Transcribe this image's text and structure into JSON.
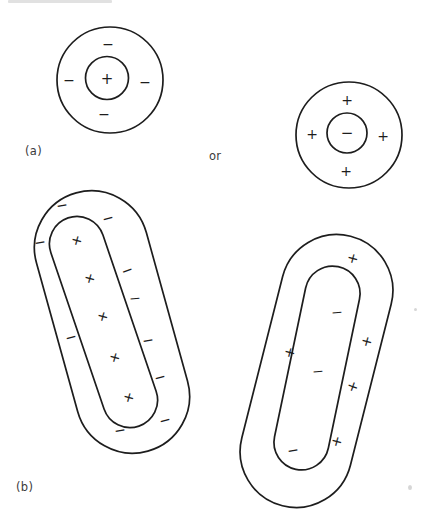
{
  "labels": {
    "panel_a": "(a)",
    "panel_b": "(b)",
    "conjunction": "or"
  },
  "colors": {
    "stroke": "#1d1d1d",
    "label": "#3b3b3b",
    "background": "#ffffff"
  },
  "diagram": {
    "shapes": [
      {
        "id": "charged-sphere-positive-core",
        "parts": [
          {
            "kind": "circle",
            "name": "outer-boundary",
            "cx": 110,
            "cy": 80,
            "r": 53
          },
          {
            "kind": "circle",
            "name": "inner-core",
            "cx": 107,
            "cy": 78,
            "r": 21.5
          }
        ],
        "signs": [
          {
            "glyph": "+",
            "x": 107,
            "y": 79,
            "size": 15
          },
          {
            "glyph": "−",
            "x": 108,
            "y": 44
          },
          {
            "glyph": "−",
            "x": 69,
            "y": 80
          },
          {
            "glyph": "−",
            "x": 145,
            "y": 82
          },
          {
            "glyph": "−",
            "x": 104,
            "y": 114
          }
        ]
      },
      {
        "id": "charged-sphere-negative-core",
        "parts": [
          {
            "kind": "circle",
            "name": "outer-boundary",
            "cx": 349,
            "cy": 135,
            "r": 53
          },
          {
            "kind": "circle",
            "name": "inner-core",
            "cx": 347,
            "cy": 133,
            "r": 20
          }
        ],
        "signs": [
          {
            "glyph": "−",
            "x": 347,
            "y": 133,
            "size": 15
          },
          {
            "glyph": "+",
            "x": 347,
            "y": 100
          },
          {
            "glyph": "+",
            "x": 312,
            "y": 134
          },
          {
            "glyph": "+",
            "x": 383,
            "y": 136
          },
          {
            "glyph": "+",
            "x": 346,
            "y": 171
          }
        ]
      },
      {
        "id": "charged-rod-negative-shell",
        "parts": [
          {
            "kind": "capsule",
            "name": "outer-boundary",
            "cx": 112,
            "cy": 322,
            "w": 114,
            "h": 268,
            "angle": -15.5
          },
          {
            "kind": "capsule",
            "name": "inner-core",
            "cx": 103.5,
            "cy": 322,
            "w": 55,
            "h": 220,
            "angle": -18.8
          }
        ],
        "signs": [
          {
            "glyph": "+",
            "x": 77,
            "y": 240,
            "rot": 15
          },
          {
            "glyph": "+",
            "x": 90,
            "y": 278,
            "rot": 15
          },
          {
            "glyph": "+",
            "x": 103,
            "y": 316,
            "rot": 15
          },
          {
            "glyph": "+",
            "x": 115,
            "y": 357,
            "rot": 15
          },
          {
            "glyph": "+",
            "x": 129,
            "y": 397,
            "rot": 15
          },
          {
            "glyph": "−",
            "x": 62,
            "y": 205,
            "rot": -10
          },
          {
            "glyph": "−",
            "x": 108,
            "y": 218,
            "rot": -15
          },
          {
            "glyph": "−",
            "x": 40,
            "y": 242,
            "rot": -10
          },
          {
            "glyph": "−",
            "x": 127,
            "y": 270,
            "rot": -20
          },
          {
            "glyph": "−",
            "x": 135,
            "y": 298,
            "rot": -5
          },
          {
            "glyph": "−",
            "x": 71,
            "y": 337,
            "rot": -15
          },
          {
            "glyph": "−",
            "x": 148,
            "y": 340,
            "rot": -10
          },
          {
            "glyph": "−",
            "x": 160,
            "y": 377,
            "rot": -15
          },
          {
            "glyph": "−",
            "x": 165,
            "y": 420,
            "rot": -15
          },
          {
            "glyph": "−",
            "x": 120,
            "y": 430,
            "rot": -10
          }
        ]
      },
      {
        "id": "charged-rod-positive-shell",
        "parts": [
          {
            "kind": "capsule",
            "name": "outer-boundary",
            "cx": 316.5,
            "cy": 371,
            "w": 112,
            "h": 278,
            "angle": 14.2
          },
          {
            "kind": "capsule",
            "name": "inner-core",
            "cx": 317,
            "cy": 368,
            "w": 55,
            "h": 207,
            "angle": 11.8
          }
        ],
        "signs": [
          {
            "glyph": "−",
            "x": 337,
            "y": 312,
            "rot": -5
          },
          {
            "glyph": "−",
            "x": 318,
            "y": 371,
            "rot": -5
          },
          {
            "glyph": "−",
            "x": 293,
            "y": 450,
            "rot": -10
          },
          {
            "glyph": "+",
            "x": 353,
            "y": 258,
            "rot": 15
          },
          {
            "glyph": "+",
            "x": 367,
            "y": 341,
            "rot": 15
          },
          {
            "glyph": "+",
            "x": 290,
            "y": 352,
            "rot": 15
          },
          {
            "glyph": "+",
            "x": 353,
            "y": 386,
            "rot": 20
          },
          {
            "glyph": "+",
            "x": 337,
            "y": 441,
            "rot": 15
          }
        ]
      }
    ]
  }
}
